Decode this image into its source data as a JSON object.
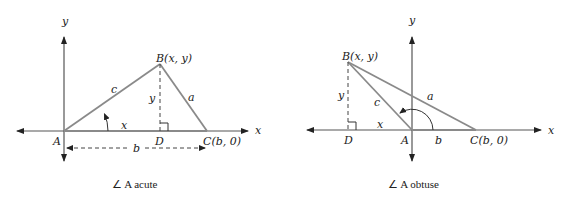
{
  "figures": [
    {
      "id": "acute",
      "caption": "∠ A acute",
      "axis_labels": {
        "x": "x",
        "y": "y"
      },
      "vertices": {
        "A": "A",
        "B": "B(x, y)",
        "C": "C(b, 0)",
        "D": "D"
      },
      "sides": {
        "a": "a",
        "b": "b",
        "c": "c"
      },
      "segment_labels": {
        "x": "x",
        "y": "y"
      }
    },
    {
      "id": "obtuse",
      "caption": "∠ A obtuse",
      "axis_labels": {
        "x": "x",
        "y": "y"
      },
      "vertices": {
        "A": "A",
        "B": "B(x, y)",
        "C": "C(b, 0)",
        "D": "D"
      },
      "sides": {
        "a": "a",
        "b": "b",
        "c": "c"
      },
      "segment_labels": {
        "x": "x",
        "y": "y"
      }
    }
  ],
  "colors": {
    "triangle_sides": "#8a8a8a",
    "axes": "#555555",
    "text": "#222222"
  }
}
